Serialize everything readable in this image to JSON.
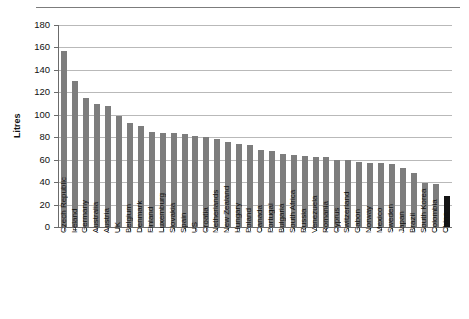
{
  "chart_data": {
    "type": "bar",
    "title": "",
    "subtitle": "",
    "xlabel": "",
    "ylabel": "Litres",
    "ylim": [
      0,
      180
    ],
    "yticks": [
      0,
      20,
      40,
      60,
      80,
      100,
      120,
      140,
      160,
      180
    ],
    "grid": true,
    "legend": null,
    "orientation": "vertical",
    "bar_color": "#7d7d7d",
    "highlight_color": "#141414",
    "highlight_category": "China",
    "categories": [
      "Czech Republic",
      "Ireland",
      "Germany",
      "Australia",
      "Austria",
      "UK",
      "Belgium",
      "Denmark",
      "Finland",
      "Luxemburg",
      "Slovakia",
      "Spain",
      "US",
      "Croatia",
      "Netherlands",
      "New Zealand",
      "Hungary",
      "Poland",
      "Canada",
      "Portugal",
      "Bulgaria",
      "South Africa",
      "Russia",
      "Venezuela",
      "Romania",
      "Cyprus",
      "Switzerland",
      "Gabon",
      "Norway",
      "Mexico",
      "Sweden",
      "Japan",
      "Brazil",
      "South Korea",
      "Colombia",
      "China"
    ],
    "values": [
      157,
      130,
      115,
      110,
      108,
      99,
      93,
      90,
      85,
      84,
      84,
      83,
      81,
      80,
      78,
      76,
      74,
      73,
      69,
      68,
      65,
      64,
      63,
      62,
      62,
      60,
      60,
      58,
      57,
      57,
      56,
      53,
      48,
      39,
      38,
      28
    ]
  }
}
